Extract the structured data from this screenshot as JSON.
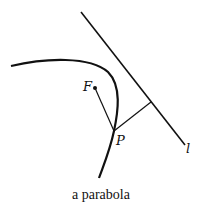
{
  "diagram": {
    "labels": {
      "focus": "F",
      "point": "P",
      "directrix": "l"
    },
    "caption": "a parabola",
    "colors": {
      "stroke": "#111111",
      "background": "#ffffff"
    }
  }
}
